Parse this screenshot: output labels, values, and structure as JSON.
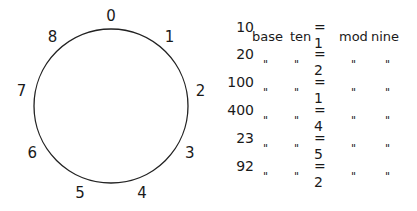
{
  "clock": {
    "modulus": 9,
    "labels": [
      "0",
      "1",
      "2",
      "3",
      "4",
      "5",
      "6",
      "7",
      "8"
    ]
  },
  "table": {
    "first_row_words": {
      "base": "base",
      "ten": "ten",
      "mod": "mod",
      "nine": "nine"
    },
    "ditto_mark": "\"",
    "rows": [
      {
        "number": "10",
        "result": "= 1"
      },
      {
        "number": "20",
        "result": "= 2"
      },
      {
        "number": "100",
        "result": "= 1"
      },
      {
        "number": "400",
        "result": "= 4"
      },
      {
        "number": "23",
        "result": "= 5"
      },
      {
        "number": "92",
        "result": "= 2"
      }
    ]
  }
}
